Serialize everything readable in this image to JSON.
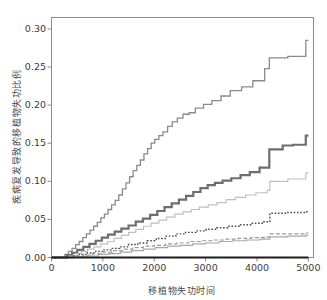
{
  "chart_data": {
    "type": "line",
    "title": "",
    "subtitle": "",
    "xlabel": "移植物失功时间",
    "ylabel": "疾病复发导致的移植物失功比例",
    "xlim": [
      0,
      5100
    ],
    "ylim": [
      0.0,
      0.315
    ],
    "xticks": [
      0,
      1000,
      2000,
      3000,
      4000,
      5000
    ],
    "xtick_labels": [
      "0",
      "1000",
      "2000",
      "3000",
      "4000",
      "5000"
    ],
    "yticks": [
      0.0,
      0.05,
      0.1,
      0.15,
      0.2,
      0.25,
      0.3
    ],
    "ytick_labels": [
      "0.00",
      "0.05",
      "0.10",
      "0.15",
      "0.20",
      "0.25",
      "0.30"
    ],
    "grid": false,
    "legend": "none",
    "step_type": "post",
    "series": [
      {
        "name": "curve-1-top",
        "style": "solid",
        "color": "#8a8a8a",
        "width": 1.3,
        "x": [
          0,
          180,
          260,
          330,
          400,
          470,
          540,
          610,
          680,
          750,
          820,
          890,
          960,
          1030,
          1100,
          1170,
          1240,
          1310,
          1380,
          1450,
          1520,
          1590,
          1660,
          1730,
          1800,
          1870,
          1940,
          2010,
          2090,
          2170,
          2260,
          2350,
          2450,
          2560,
          2680,
          2800,
          2960,
          3120,
          3300,
          3480,
          3700,
          3920,
          4150,
          4240,
          4600,
          4950,
          5000
        ],
        "y": [
          0.0,
          0.0,
          0.004,
          0.008,
          0.012,
          0.017,
          0.021,
          0.026,
          0.031,
          0.036,
          0.041,
          0.046,
          0.052,
          0.057,
          0.063,
          0.069,
          0.075,
          0.082,
          0.09,
          0.098,
          0.106,
          0.114,
          0.121,
          0.128,
          0.136,
          0.143,
          0.15,
          0.155,
          0.16,
          0.165,
          0.172,
          0.178,
          0.183,
          0.188,
          0.19,
          0.196,
          0.201,
          0.206,
          0.212,
          0.219,
          0.224,
          0.232,
          0.248,
          0.262,
          0.264,
          0.285,
          0.285
        ]
      },
      {
        "name": "curve-2-thick-dark",
        "style": "solid",
        "color": "#6e6e6e",
        "width": 2.2,
        "x": [
          0,
          200,
          300,
          400,
          500,
          620,
          740,
          860,
          980,
          1100,
          1230,
          1360,
          1500,
          1640,
          1780,
          1920,
          2060,
          2200,
          2340,
          2480,
          2620,
          2760,
          2900,
          3040,
          3180,
          3330,
          3500,
          3680,
          3860,
          4050,
          4240,
          4500,
          4700,
          4950,
          5000
        ],
        "y": [
          0.0,
          0.0,
          0.003,
          0.006,
          0.01,
          0.014,
          0.018,
          0.022,
          0.026,
          0.03,
          0.034,
          0.038,
          0.042,
          0.047,
          0.051,
          0.056,
          0.061,
          0.066,
          0.071,
          0.076,
          0.081,
          0.086,
          0.091,
          0.095,
          0.098,
          0.101,
          0.104,
          0.108,
          0.112,
          0.118,
          0.142,
          0.147,
          0.148,
          0.16,
          0.16
        ]
      },
      {
        "name": "curve-3-light",
        "style": "solid",
        "color": "#c0c0c0",
        "width": 1.2,
        "x": [
          0,
          230,
          340,
          460,
          580,
          700,
          830,
          960,
          1090,
          1220,
          1360,
          1500,
          1640,
          1790,
          1940,
          2090,
          2240,
          2400,
          2560,
          2720,
          2880,
          3050,
          3220,
          3400,
          3580,
          3780,
          3980,
          4200,
          4250,
          4600,
          4950,
          5000
        ],
        "y": [
          0.0,
          0.0,
          0.002,
          0.005,
          0.008,
          0.011,
          0.014,
          0.018,
          0.021,
          0.025,
          0.029,
          0.033,
          0.037,
          0.041,
          0.045,
          0.049,
          0.053,
          0.057,
          0.06,
          0.063,
          0.066,
          0.069,
          0.072,
          0.076,
          0.079,
          0.082,
          0.085,
          0.088,
          0.1,
          0.103,
          0.111,
          0.111
        ]
      },
      {
        "name": "curve-4-dotted",
        "style": "dotted",
        "color": "#4a4a4a",
        "width": 1.4,
        "x": [
          0,
          260,
          400,
          540,
          690,
          840,
          1000,
          1160,
          1330,
          1500,
          1680,
          1860,
          2040,
          2230,
          2420,
          2610,
          2810,
          3010,
          3220,
          3430,
          3650,
          3880,
          4120,
          4250,
          4600,
          4950,
          5000
        ],
        "y": [
          0.0,
          0.0,
          0.002,
          0.004,
          0.006,
          0.008,
          0.01,
          0.012,
          0.014,
          0.017,
          0.019,
          0.022,
          0.025,
          0.028,
          0.031,
          0.033,
          0.035,
          0.037,
          0.039,
          0.041,
          0.043,
          0.045,
          0.047,
          0.058,
          0.059,
          0.06,
          0.06
        ]
      },
      {
        "name": "curve-5-dashed",
        "style": "dashed",
        "color": "#9a9a9a",
        "width": 1.2,
        "x": [
          0,
          280,
          450,
          620,
          800,
          990,
          1180,
          1380,
          1580,
          1790,
          2000,
          2220,
          2440,
          2670,
          2900,
          3140,
          3380,
          3630,
          3880,
          4140,
          4250,
          4600,
          4950,
          5000
        ],
        "y": [
          0.0,
          0.0,
          0.001,
          0.003,
          0.005,
          0.007,
          0.009,
          0.011,
          0.013,
          0.015,
          0.016,
          0.018,
          0.019,
          0.021,
          0.022,
          0.023,
          0.024,
          0.025,
          0.026,
          0.027,
          0.031,
          0.031,
          0.032,
          0.032
        ]
      },
      {
        "name": "curve-6-grey-solid",
        "style": "solid",
        "color": "#a8a8a8",
        "width": 1.2,
        "x": [
          0,
          300,
          500,
          700,
          910,
          1120,
          1340,
          1560,
          1790,
          2020,
          2260,
          2500,
          2750,
          3000,
          3260,
          3520,
          3790,
          4060,
          4250,
          4600,
          4950,
          5000
        ],
        "y": [
          0.0,
          0.0,
          0.001,
          0.002,
          0.004,
          0.005,
          0.007,
          0.009,
          0.011,
          0.013,
          0.015,
          0.016,
          0.018,
          0.019,
          0.021,
          0.022,
          0.023,
          0.024,
          0.027,
          0.028,
          0.029,
          0.029
        ]
      },
      {
        "name": "curve-7-baseline",
        "style": "solid",
        "color": "#1d1d1d",
        "width": 1.9,
        "x": [
          0,
          5000
        ],
        "y": [
          0.0,
          0.0
        ]
      }
    ]
  }
}
